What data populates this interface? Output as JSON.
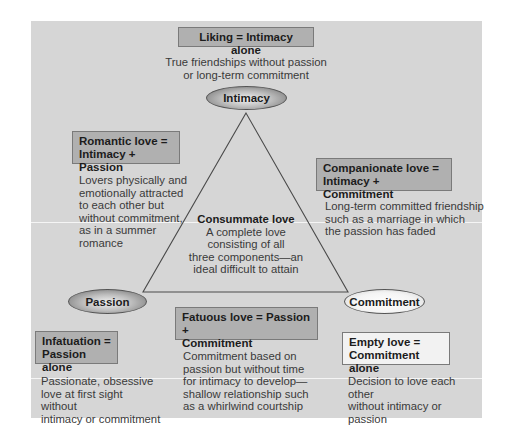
{
  "diagram": {
    "type": "triangular theory of love",
    "components": {
      "intimacy": "Intimacy",
      "passion": "Passion",
      "commitment": "Commitment"
    },
    "liking": {
      "title": "Liking = Intimacy alone",
      "desc_lines": [
        "True friendships without passion",
        "or long-term commitment"
      ]
    },
    "romantic": {
      "title_lines": [
        "Romantic love =",
        "Intimacy + Passion"
      ],
      "desc_lines": [
        "Lovers physically and",
        "emotionally attracted",
        "to each other but",
        "without commitment,",
        "as in a summer",
        "romance"
      ]
    },
    "companionate": {
      "title_lines": [
        "Companionate love =",
        "Intimacy + Commitment"
      ],
      "desc_lines": [
        "Long-term committed friendship",
        "such as a marriage in which",
        "the passion has faded"
      ]
    },
    "consummate": {
      "title": "Consummate love",
      "desc_lines": [
        "A complete love",
        "consisting of all",
        "three components—an",
        "ideal difficult to attain"
      ]
    },
    "fatuous": {
      "title_lines": [
        "Fatuous love = Passion +",
        "Commitment"
      ],
      "desc_lines": [
        "Commitment based on",
        "passion but without time",
        "for intimacy to develop—",
        "shallow relationship such",
        "as a whirlwind courtship"
      ]
    },
    "infatuation": {
      "title_lines": [
        "Infatuation =",
        "Passion alone"
      ],
      "desc_lines": [
        "Passionate, obsessive",
        "love at first sight without",
        "intimacy or commitment"
      ]
    },
    "empty": {
      "title_lines": [
        "Empty love =",
        "Commitment alone"
      ],
      "desc_lines": [
        "Decision to love each other",
        "without intimacy or passion"
      ]
    }
  },
  "colors": {
    "panel": "#d6d6d6",
    "box_dark": "#b0b0b0",
    "box_light": "#f2f2f2",
    "line": "#4a4a4a"
  }
}
